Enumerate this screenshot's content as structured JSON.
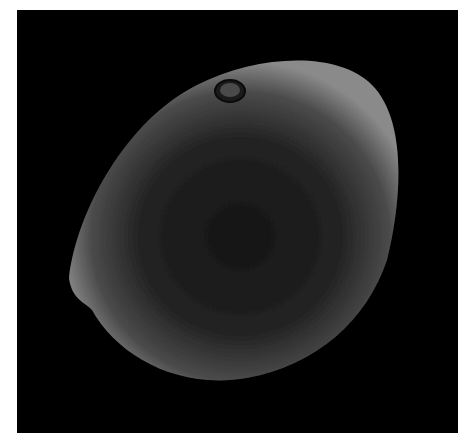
{
  "image": {
    "subject": "pollen-grain",
    "description": "Scanning electron micrograph of a single ovoid pollen grain with a small circular pore near the top, on a black background",
    "background_color": "#000000",
    "frame_color": "#ffffff",
    "grain_rim_color": "#8a8a8a",
    "grain_center_color": "#1a1a1a"
  }
}
